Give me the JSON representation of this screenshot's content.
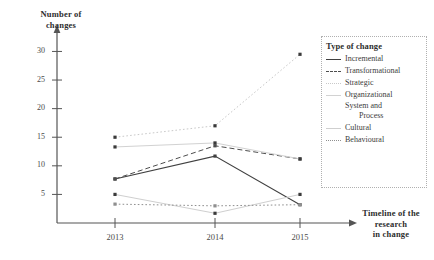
{
  "chart_data": {
    "type": "line",
    "title": "",
    "xlabel": "Timeline of the research in change",
    "ylabel": "Number of changes",
    "categories": [
      "2013",
      "2014",
      "2015"
    ],
    "xticks": [
      "2013",
      "2014",
      "2015"
    ],
    "yticks": [
      5,
      10,
      15,
      20,
      25,
      30
    ],
    "ylim": [
      0,
      32
    ],
    "grid": false,
    "legend_position": "right",
    "legend_title": "Type of change",
    "series": [
      {
        "name": "Incremental",
        "values": [
          7.7,
          11.7,
          3.2
        ],
        "style": "solid",
        "color": "#404040",
        "width": 1.1
      },
      {
        "name": "Transformational",
        "values": [
          7.7,
          13.5,
          11.2
        ],
        "style": "dashed",
        "color": "#4d4d4d",
        "width": 1.0
      },
      {
        "name": "Strategic",
        "values": [
          15.0,
          17.0,
          29.5
        ],
        "style": "dotted",
        "color": "#c9c9c9",
        "width": 1.0
      },
      {
        "name": "Organizational System and Process",
        "values": [
          13.3,
          14.0,
          11.2
        ],
        "style": "solid",
        "color": "#d2d2d2",
        "width": 1.0
      },
      {
        "name": "Cultural",
        "values": [
          5.0,
          1.7,
          5.0
        ],
        "style": "solid",
        "color": "#cfcfcf",
        "width": 1.0
      },
      {
        "name": "Behavioural",
        "values": [
          3.3,
          3.0,
          3.2
        ],
        "style": "dotted",
        "color": "#8f8f8f",
        "width": 1.0
      }
    ]
  },
  "axes": {
    "y_title_line1": "Number of",
    "y_title_line2": "changes",
    "x_title_line1": "Timeline of the",
    "x_title_line2": "research",
    "x_title_line3": "in change"
  },
  "legend": {
    "title": "Type of change",
    "items": [
      {
        "label": "Incremental"
      },
      {
        "label": "Transformational"
      },
      {
        "label": "Strategic"
      },
      {
        "label": "Organizational"
      },
      {
        "label": "System and"
      },
      {
        "label": "Process"
      },
      {
        "label": "Cultural"
      },
      {
        "label": "Behavioural"
      }
    ]
  }
}
